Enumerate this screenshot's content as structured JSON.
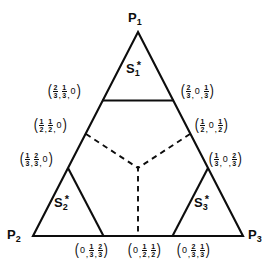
{
  "figure": {
    "type": "simplex-diagram",
    "background_color": "#ffffff",
    "line_color": "#0d0d0d"
  },
  "vertices": [
    {
      "id": "p1",
      "label_base": "P",
      "label_sub": "1",
      "position": "top"
    },
    {
      "id": "p2",
      "label_base": "P",
      "label_sub": "2",
      "position": "bottom-left"
    },
    {
      "id": "p3",
      "label_base": "P",
      "label_sub": "3",
      "position": "bottom-right"
    }
  ],
  "regions": [
    {
      "id": "s1",
      "label_base": "S",
      "label_sub": "1",
      "label_sup": "*",
      "position": "top"
    },
    {
      "id": "s2",
      "label_base": "S",
      "label_sub": "2",
      "label_sup": "*",
      "position": "bottom-left"
    },
    {
      "id": "s3",
      "label_base": "S",
      "label_sub": "3",
      "label_sup": "*",
      "position": "bottom-right"
    }
  ],
  "coordinates": [
    {
      "id": "c-left-upper",
      "text": "(2/3, 1/3, 0)",
      "parts": [
        {
          "kind": "frac",
          "num": "2",
          "den": "3"
        },
        {
          "kind": "comma",
          "text": ","
        },
        {
          "kind": "frac",
          "num": "1",
          "den": "3"
        },
        {
          "kind": "comma",
          "text": ","
        },
        {
          "kind": "zero",
          "text": "0"
        }
      ]
    },
    {
      "id": "c-right-upper",
      "text": "(2/3, 0, 1/3)",
      "parts": [
        {
          "kind": "frac",
          "num": "2",
          "den": "3"
        },
        {
          "kind": "comma",
          "text": ","
        },
        {
          "kind": "zero",
          "text": "0"
        },
        {
          "kind": "comma",
          "text": ","
        },
        {
          "kind": "frac",
          "num": "1",
          "den": "3"
        }
      ]
    },
    {
      "id": "c-left-mid",
      "text": "(1/2, 1/2, 0)",
      "parts": [
        {
          "kind": "frac",
          "num": "1",
          "den": "2"
        },
        {
          "kind": "comma",
          "text": ","
        },
        {
          "kind": "frac",
          "num": "1",
          "den": "2"
        },
        {
          "kind": "comma",
          "text": ","
        },
        {
          "kind": "zero",
          "text": "0"
        }
      ]
    },
    {
      "id": "c-right-mid",
      "text": "(1/2, 0, 1/2)",
      "parts": [
        {
          "kind": "frac",
          "num": "1",
          "den": "2"
        },
        {
          "kind": "comma",
          "text": ","
        },
        {
          "kind": "zero",
          "text": "0"
        },
        {
          "kind": "comma",
          "text": ","
        },
        {
          "kind": "frac",
          "num": "1",
          "den": "2"
        }
      ]
    },
    {
      "id": "c-left-lower",
      "text": "(1/3, 2/3, 0)",
      "parts": [
        {
          "kind": "frac",
          "num": "1",
          "den": "3"
        },
        {
          "kind": "comma",
          "text": ","
        },
        {
          "kind": "frac",
          "num": "2",
          "den": "3"
        },
        {
          "kind": "comma",
          "text": ","
        },
        {
          "kind": "zero",
          "text": "0"
        }
      ]
    },
    {
      "id": "c-right-lower",
      "text": "(1/3, 0, 2/3)",
      "parts": [
        {
          "kind": "frac",
          "num": "1",
          "den": "3"
        },
        {
          "kind": "comma",
          "text": ","
        },
        {
          "kind": "zero",
          "text": "0"
        },
        {
          "kind": "comma",
          "text": ","
        },
        {
          "kind": "frac",
          "num": "2",
          "den": "3"
        }
      ]
    },
    {
      "id": "c-bottom-left",
      "text": "(0, 1/3, 2/3)",
      "parts": [
        {
          "kind": "zero",
          "text": "0"
        },
        {
          "kind": "comma",
          "text": ","
        },
        {
          "kind": "frac",
          "num": "1",
          "den": "3"
        },
        {
          "kind": "comma",
          "text": ","
        },
        {
          "kind": "frac",
          "num": "2",
          "den": "3"
        }
      ]
    },
    {
      "id": "c-bottom-center",
      "text": "(0, 1/2, 1/2)",
      "parts": [
        {
          "kind": "zero",
          "text": "0"
        },
        {
          "kind": "comma",
          "text": ","
        },
        {
          "kind": "frac",
          "num": "1",
          "den": "2"
        },
        {
          "kind": "comma",
          "text": ","
        },
        {
          "kind": "frac",
          "num": "1",
          "den": "2"
        }
      ]
    },
    {
      "id": "c-bottom-right",
      "text": "(0, 2/3, 1/3)",
      "parts": [
        {
          "kind": "zero",
          "text": "0"
        },
        {
          "kind": "comma",
          "text": ","
        },
        {
          "kind": "frac",
          "num": "2",
          "den": "3"
        },
        {
          "kind": "comma",
          "text": ","
        },
        {
          "kind": "frac",
          "num": "1",
          "den": "3"
        }
      ]
    }
  ],
  "chart_data": {
    "type": "diagram",
    "title": "",
    "triangle": {
      "p1": [
        138,
        32
      ],
      "p2": [
        33,
        236
      ],
      "p3": [
        243,
        236
      ]
    },
    "solid_segments": [
      {
        "name": "s1-cut",
        "from": [
          103,
          100
        ],
        "to": [
          173,
          100
        ]
      },
      {
        "name": "s2-right-edge",
        "from": [
          68,
          168
        ],
        "to": [
          103,
          236
        ]
      },
      {
        "name": "s3-left-edge",
        "from": [
          208,
          168
        ],
        "to": [
          173,
          236
        ]
      }
    ],
    "dashed_segments": [
      {
        "name": "left-branch",
        "from": [
          85,
          134
        ],
        "to": [
          138,
          168
        ]
      },
      {
        "name": "right-branch",
        "from": [
          191,
          134
        ],
        "to": [
          138,
          168
        ]
      },
      {
        "name": "center-stem",
        "from": [
          138,
          168
        ],
        "to": [
          138,
          236
        ]
      }
    ]
  }
}
